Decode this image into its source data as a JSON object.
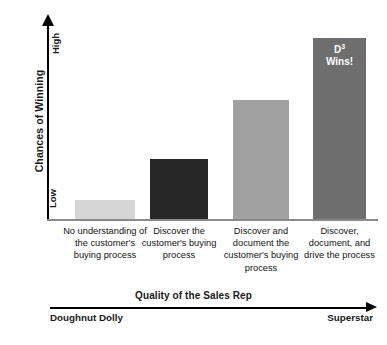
{
  "chart_data": {
    "type": "bar",
    "title": "",
    "xlabel": "Quality of the Sales Rep",
    "ylabel": "Chances of Winning",
    "categories": [
      "No understanding of the customer's buying process",
      "Discover the customer's buying process",
      "Discover and document the customer's buying process",
      "Discover, document, and drive the process"
    ],
    "values": [
      10,
      31,
      61,
      93
    ],
    "ylim": [
      0,
      100
    ],
    "y_tick_labels": [
      "Low",
      "High"
    ],
    "x_end_labels": [
      "Doughnut Dolly",
      "Superstar"
    ],
    "grid": false,
    "legend": "none",
    "bar_colors": [
      "#d6d6d6",
      "#262626",
      "#a0a0a0",
      "#6e6e6e"
    ],
    "annotations": [
      {
        "bar_index": 3,
        "line1": "D",
        "superscript": "3",
        "line2": "Wins!",
        "color": "#ffffff"
      }
    ]
  },
  "axes": {
    "y_title": "Chances of Winning",
    "y_high": "High",
    "y_low": "Low",
    "x_title": "Quality of the Sales Rep",
    "x_left_end": "Doughnut Dolly",
    "x_right_end": "Superstar"
  },
  "bars": [
    {
      "label": "No understanding of the customer's buying process",
      "value": 10,
      "color": "#d6d6d6"
    },
    {
      "label": "Discover the customer's buying process",
      "value": 31,
      "color": "#262626"
    },
    {
      "label": "Discover and document the customer's buying process",
      "value": 61,
      "color": "#a0a0a0"
    },
    {
      "label": "Discover, document, and drive the process",
      "value": 93,
      "color": "#6e6e6e"
    }
  ],
  "annotation": {
    "d_letter": "D",
    "d_exponent": "3",
    "wins_text": "Wins!"
  }
}
